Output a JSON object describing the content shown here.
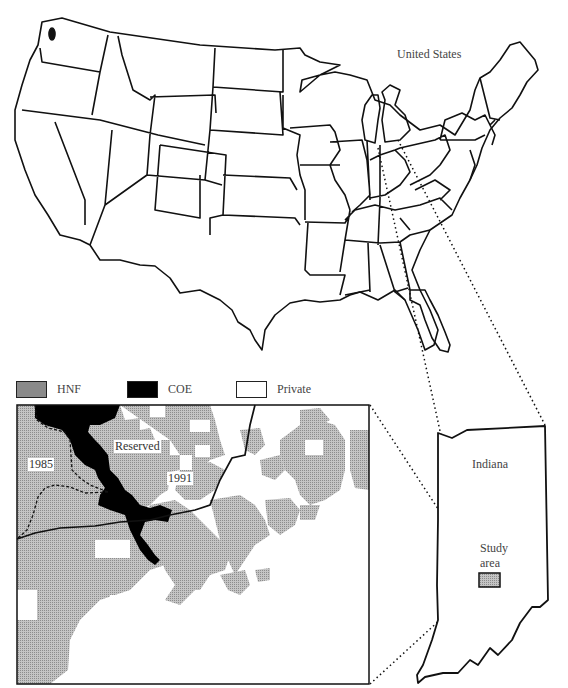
{
  "figure": {
    "us_map": {
      "label": "United States"
    },
    "legend": {
      "items": [
        {
          "key": "hnf",
          "label": "HNF",
          "color": "#b8b8b8"
        },
        {
          "key": "coe",
          "label": "COE",
          "color": "#000000"
        },
        {
          "key": "private",
          "label": "Private",
          "color": "#ffffff"
        }
      ]
    },
    "detail_map": {
      "labels": {
        "reserved": "Reserved",
        "year_1985": "1985",
        "year_1991": "1991"
      }
    },
    "indiana_map": {
      "state_label": "Indiana",
      "study_area_label_line1": "Study",
      "study_area_label_line2": "area"
    },
    "colors": {
      "line": "#111111",
      "hnf_fill": "#b8b8b8",
      "coe_fill": "#000000"
    }
  }
}
